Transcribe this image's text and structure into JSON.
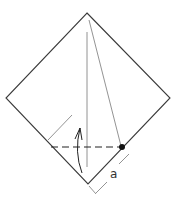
{
  "diagram": {
    "type": "origami-fold-step",
    "colors": {
      "outline": "#3a3a3a",
      "crease": "#777777",
      "fold_line": "#222222",
      "reference_point": "#111111",
      "background": "#ffffff"
    },
    "square": {
      "top": [
        87,
        13
      ],
      "right": [
        170,
        98
      ],
      "bottom": [
        88,
        184
      ],
      "left": [
        6,
        98
      ]
    },
    "creases": [
      {
        "name": "vertical-center-crease",
        "from": [
          87,
          32
        ],
        "to": [
          87,
          167
        ]
      },
      {
        "name": "diagonal-crease-to-point",
        "from": [
          89,
          20
        ],
        "to": [
          121,
          146
        ]
      }
    ],
    "valley_fold_line": {
      "from": [
        51,
        147
      ],
      "to": [
        121,
        147
      ],
      "style": "dashed"
    },
    "reference_point": {
      "cx": 122,
      "cy": 147,
      "r": 3
    },
    "fold_arrow": {
      "direction": "up",
      "label": ""
    },
    "dimension": {
      "label": "a",
      "left_tick": {
        "from": [
          48,
          140
        ],
        "to": [
          72,
          115
        ]
      },
      "right_ticks": [
        {
          "from": [
            129,
            154
          ],
          "to": [
            119,
            164
          ]
        },
        {
          "from": [
            89,
            186
          ],
          "to": [
            96,
            194
          ]
        },
        {
          "from": [
            96,
            193
          ],
          "to": [
            107,
            182
          ]
        }
      ]
    }
  }
}
